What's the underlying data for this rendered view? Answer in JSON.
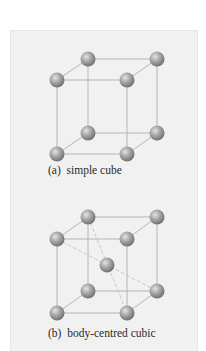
{
  "figures": [
    {
      "id": "a",
      "caption": "(a)  simple cube",
      "type": "simple-cubic"
    },
    {
      "id": "b",
      "caption": "(b)  body-centred cubic",
      "type": "body-centred-cubic"
    }
  ],
  "colors": {
    "panel_bg": "#f1f1f1",
    "edge": "#b5b5b5",
    "diagonal": "#c9c9c9",
    "atom_light": "#d8d8d8",
    "atom_mid": "#9a9a9a",
    "atom_dark": "#6b6b6b"
  }
}
